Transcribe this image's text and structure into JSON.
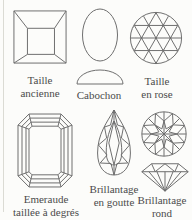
{
  "figure": {
    "background": "#fcfcfa",
    "line_color": "#6f6f6f",
    "text_color": "#4b4b4b",
    "cuts": [
      {
        "name": "taille-ancienne",
        "drawing": "table-cut-top-view",
        "label1": "Taille",
        "label2": "ancienne"
      },
      {
        "name": "cabochon",
        "drawing": "cabochon-top-and-profile-view",
        "label1": "Cabochon",
        "label2": ""
      },
      {
        "name": "taille-en-rose",
        "drawing": "rose-cut-top-view",
        "label1": "Taille",
        "label2": "en rose"
      },
      {
        "name": "emeraude-taillee-a-degres",
        "drawing": "emerald-step-cut-top-view",
        "label1": "Emeraude",
        "label2": "taillée à degrés"
      },
      {
        "name": "brillantage-en-goutte",
        "drawing": "pear-brilliant-cut-top-view",
        "label1": "Brillantage",
        "label2": "en goutte"
      },
      {
        "name": "brillantage-rond",
        "drawing": "round-brilliant-top-and-profile-view",
        "label1": "Brillantage",
        "label2": "rond"
      }
    ]
  }
}
